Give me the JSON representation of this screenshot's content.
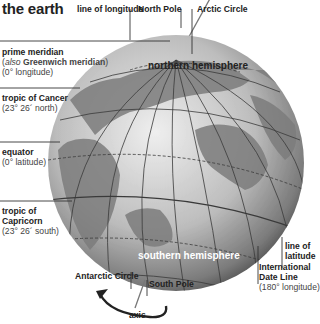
{
  "title": "the earth",
  "labels": {
    "line_of_longitude": "line of longitude",
    "north_pole": "North Pole",
    "arctic_circle": "Arctic Circle",
    "prime_meridian": {
      "name": "prime meridian",
      "also_prefix": "also",
      "also_name": "Greenwich meridian",
      "paren_open": "(",
      "paren_close": ")",
      "detail": "(0° longitude)"
    },
    "tropic_of_cancer": {
      "name": "tropic of Cancer",
      "detail": "(23° 26´ north)"
    },
    "equator": {
      "name": "equator",
      "detail": "(0° latitude)"
    },
    "tropic_of_capricorn": {
      "line1": "tropic of",
      "line2": "Capricorn",
      "detail": "(23° 26´ south)"
    },
    "line_of_latitude": {
      "line1": "line of",
      "line2": "latitude"
    },
    "international_date_line": {
      "line1": "International",
      "line2": "Date Line",
      "detail": "(180° longitude)"
    },
    "antarctic_circle": "Antarctic Circle",
    "south_pole": "South Pole",
    "axis": "axis",
    "northern_hemisphere": "northern hemisphere",
    "southern_hemisphere": "southern hemisphere"
  },
  "colors": {
    "ocean": "#c8c8c8",
    "land": "#7a7a7a",
    "grid": "#333333",
    "text": "#222222",
    "hemisphere_south_text": "#ffffff"
  }
}
